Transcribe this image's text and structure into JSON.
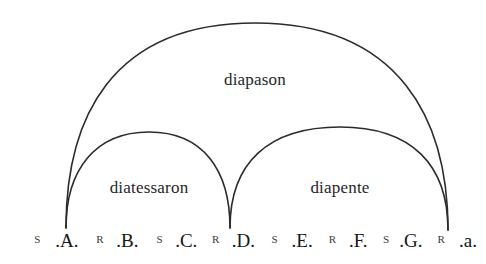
{
  "figure": {
    "background_color": "#ffffff",
    "ink_color": "#2b2b2b"
  },
  "arcs": [
    {
      "id": "diapason",
      "label": "diapason",
      "from_note": "A",
      "to_note": "a",
      "label_x": 255,
      "label_y": 70
    },
    {
      "id": "diatessaron",
      "label": "diatessaron",
      "from_note": "A",
      "to_note": "D",
      "label_x": 149,
      "label_y": 178
    },
    {
      "id": "diapente",
      "label": "diapente",
      "from_note": "D",
      "to_note": "a",
      "label_x": 340,
      "label_y": 178
    }
  ],
  "scale": {
    "items": [
      {
        "kind": "interval",
        "text": "S",
        "x": 33
      },
      {
        "kind": "note",
        "text": ".A.",
        "x": 66
      },
      {
        "kind": "interval",
        "text": "R",
        "x": 103
      },
      {
        "kind": "note",
        "text": ".B.",
        "x": 134
      },
      {
        "kind": "interval",
        "text": "S",
        "x": 170
      },
      {
        "kind": "note",
        "text": ".C.",
        "x": 200
      },
      {
        "kind": "interval",
        "text": "R",
        "x": 233
      },
      {
        "kind": "note",
        "text": ".D.",
        "x": 264
      },
      {
        "kind": "interval",
        "text": "S",
        "x": 299
      },
      {
        "kind": "note",
        "text": ".E.",
        "x": 330
      },
      {
        "kind": "interval",
        "text": "R",
        "x": 364
      },
      {
        "kind": "note",
        "text": ".F.",
        "x": 393
      },
      {
        "kind": "interval",
        "text": "S",
        "x": 424
      },
      {
        "kind": "note",
        "text": ".G.",
        "x": 452
      },
      {
        "kind": "interval",
        "text": "R",
        "x": 486
      },
      {
        "kind": "note",
        "text": ".a.",
        "x": 516
      }
    ]
  }
}
